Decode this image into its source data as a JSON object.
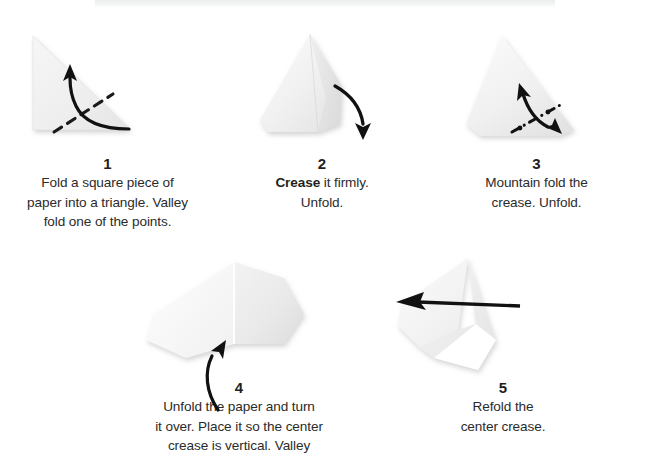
{
  "document": {
    "kind": "origami-instruction-diagram",
    "background_color": "#ffffff",
    "paper_color": "#f0f0f0",
    "ink_color": "#231f20"
  },
  "steps": [
    {
      "number": "1",
      "line1": "Fold a square piece of",
      "line2": "paper into a triangle. Valley",
      "line3": "fold one of the points.",
      "figure": "right-triangle-with-valley-fold"
    },
    {
      "number": "2",
      "line1_bold": "Crease",
      "line1_rest": " it firmly.",
      "line2": "Unfold.",
      "figure": "cone-with-folded-flap"
    },
    {
      "number": "3",
      "line1": "Mountain fold the",
      "line2": "crease. Unfold.",
      "figure": "triangle-with-mountain-fold"
    },
    {
      "number": "4",
      "line1": "Unfold the paper and turn",
      "line2": "it over. Place it so the center",
      "line3": "crease is vertical. Valley",
      "figure": "opened-paper-center-crease-vertical"
    },
    {
      "number": "5",
      "line1": "Refold the",
      "line2": "center crease.",
      "figure": "refolded-paper-with-arrow"
    }
  ]
}
